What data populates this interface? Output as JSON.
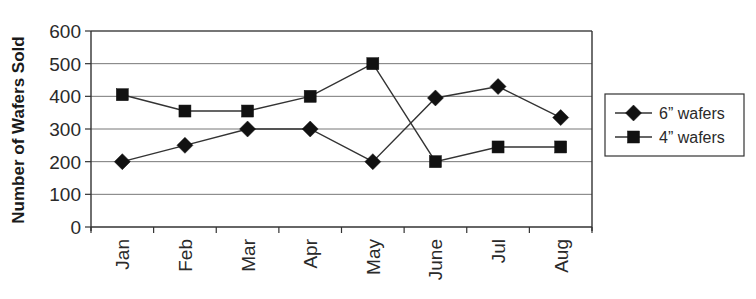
{
  "chart_data": {
    "type": "line",
    "title": "",
    "xlabel": "",
    "ylabel": "Number of Wafers Sold",
    "categories": [
      "Jan",
      "Feb",
      "Mar",
      "Apr",
      "May",
      "June",
      "Jul",
      "Aug"
    ],
    "series": [
      {
        "name": "6” wafers",
        "marker": "diamond",
        "values": [
          200,
          250,
          300,
          300,
          200,
          395,
          430,
          335
        ]
      },
      {
        "name": "4” wafers",
        "marker": "square",
        "values": [
          405,
          355,
          355,
          400,
          500,
          200,
          245,
          245
        ]
      }
    ],
    "ylim": [
      0,
      600
    ],
    "yticks": [
      0,
      100,
      200,
      300,
      400,
      500,
      600
    ],
    "grid": true,
    "legend_position": "right"
  },
  "colors": {
    "line": "#333333",
    "marker": "#111111",
    "grid": "#777777",
    "axis": "#333333"
  }
}
